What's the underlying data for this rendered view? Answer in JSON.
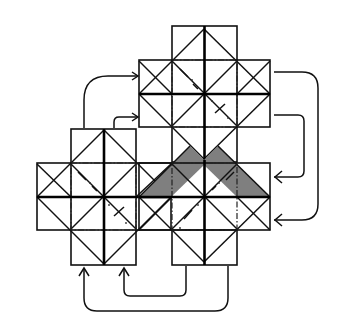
{
  "diagram": {
    "type": "folding-pattern",
    "colors": {
      "light_unit": "#f0f0f0",
      "medium_unit": "#a8a8a8",
      "dark_unit": "#7f7f7f",
      "white_center": "#ffffff",
      "line": "#111111"
    },
    "units": [
      {
        "id": "top-unit",
        "shade": "light",
        "center": [
          204,
          94
        ]
      },
      {
        "id": "left-unit",
        "shade": "medium",
        "center": [
          104,
          197
        ]
      },
      {
        "id": "bottom-right-unit",
        "shade": "dark",
        "center": [
          204,
          197
        ]
      }
    ],
    "arrows": [
      {
        "id": "arrow-left-to-top-upper",
        "from": "left-unit",
        "to": "top-unit"
      },
      {
        "id": "arrow-left-to-top-lower",
        "from": "left-unit",
        "to": "top-unit"
      },
      {
        "id": "arrow-top-to-bottom-right-inner",
        "from": "top-unit",
        "to": "bottom-right-unit"
      },
      {
        "id": "arrow-top-to-bottom-right-outer",
        "from": "top-unit",
        "to": "bottom-right-unit"
      },
      {
        "id": "arrow-bottom-right-to-left-inner",
        "from": "bottom-right-unit",
        "to": "left-unit"
      },
      {
        "id": "arrow-bottom-right-to-left-outer",
        "from": "bottom-right-unit",
        "to": "left-unit"
      }
    ]
  }
}
